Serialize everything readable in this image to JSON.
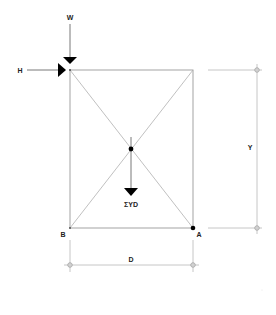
{
  "diagram": {
    "title": "",
    "labels": {
      "vertical_load": "W",
      "horizontal_load": "H",
      "resultant": "ΣYD",
      "height_dim": "Y",
      "width_dim": "D",
      "corner_left": "B",
      "corner_right": "A"
    },
    "geometry": {
      "frame": {
        "x": 70,
        "y": 70,
        "width": 123,
        "height": 158
      },
      "center": {
        "x": 131,
        "y": 149
      }
    },
    "colors": {
      "lines": "#9a9a9a",
      "arrows": "#000000",
      "text": "#222222"
    }
  }
}
